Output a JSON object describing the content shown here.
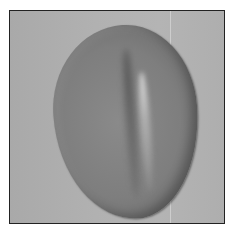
{
  "image": {
    "subject": "oval-seed-object",
    "colors": {
      "background": "#b0b0b0",
      "object": "#7e7e7e",
      "highlight": "#e0e0e0",
      "border": "#222222"
    }
  }
}
